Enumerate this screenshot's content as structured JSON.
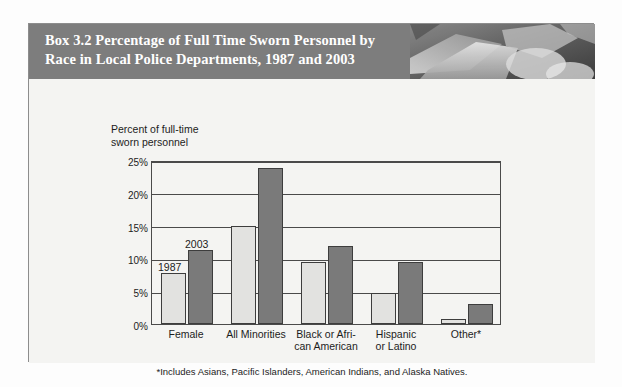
{
  "header": {
    "title": "Box 3.2  Percentage of Full Time Sworn Personnel by\nRace in Local Police Departments, 1987 and 2003",
    "photo_alt": "photo-hands-documents"
  },
  "colors": {
    "header_band": "#7d7d7d",
    "panel_background": "#f4f4f2",
    "bar_1987": "#e2e2e0",
    "bar_2003": "#7a7a7a",
    "axis": "#4a4a4a",
    "text": "#1c1c1c"
  },
  "chart_data": {
    "type": "bar",
    "title": "Percentage of Full Time Sworn Personnel by Race in Local Police Departments, 1987 and 2003",
    "ylabel": "Percent of full-time\nsworn personnel",
    "xlabel": "",
    "categories": [
      "Female",
      "All Minorities",
      "Black or Afri-\ncan American",
      "Hispanic\nor Latino",
      "Other*"
    ],
    "series": [
      {
        "name": "1987",
        "values": [
          7.8,
          15.0,
          9.5,
          4.8,
          0.8
        ]
      },
      {
        "name": "2003",
        "values": [
          11.3,
          23.8,
          11.9,
          9.5,
          3.0
        ]
      }
    ],
    "ylim": [
      0,
      25
    ],
    "yticks": [
      0,
      5,
      10,
      15,
      20,
      25
    ],
    "ytick_labels": [
      "0%",
      "5%",
      "10%",
      "15%",
      "20%",
      "25%"
    ],
    "grid": true,
    "legend_position": "inline-annotations",
    "annotations": [
      {
        "text": "1987",
        "series": "1987",
        "category": "Female"
      },
      {
        "text": "2003",
        "series": "2003",
        "category": "Female"
      }
    ],
    "footnote": "*Includes Asians, Pacific Islanders, American Indians, and Alaska Natives."
  }
}
